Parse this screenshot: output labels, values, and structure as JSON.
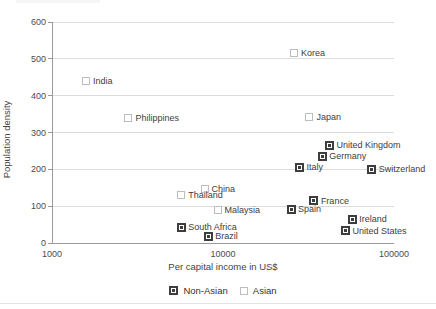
{
  "chart_data": {
    "type": "scatter",
    "title": "",
    "xlabel": "Per capital income in US$",
    "ylabel": "Population density",
    "x_axis": {
      "scale": "log",
      "min": 1000,
      "max": 100000,
      "ticks": [
        1000,
        10000,
        100000
      ]
    },
    "y_axis": {
      "min": 0,
      "max": 600,
      "ticks": [
        0,
        100,
        200,
        300,
        400,
        500,
        600
      ]
    },
    "grid": "horizontal",
    "legend_position": "bottom",
    "colors": {
      "non_asian_marker": "#3d3d3d",
      "asian_marker": "#bdbdbd",
      "gridline": "#dcdcdc",
      "axis": "#9a9a9a"
    },
    "series": [
      {
        "name": "Non-Asian",
        "marker": "filled-square",
        "points": [
          {
            "label": "United Kingdom",
            "x": 42000,
            "y": 265
          },
          {
            "label": "Germany",
            "x": 38000,
            "y": 235
          },
          {
            "label": "Italy",
            "x": 28000,
            "y": 205
          },
          {
            "label": "Switzerland",
            "x": 74000,
            "y": 200
          },
          {
            "label": "France",
            "x": 34000,
            "y": 115
          },
          {
            "label": "Spain",
            "x": 25000,
            "y": 92
          },
          {
            "label": "Ireland",
            "x": 57000,
            "y": 65
          },
          {
            "label": "United States",
            "x": 52000,
            "y": 33
          },
          {
            "label": "South Africa",
            "x": 5700,
            "y": 43
          },
          {
            "label": "Brazil",
            "x": 8200,
            "y": 19
          }
        ]
      },
      {
        "name": "Asian",
        "marker": "open-square",
        "points": [
          {
            "label": "Korea",
            "x": 26000,
            "y": 515
          },
          {
            "label": "India",
            "x": 1580,
            "y": 440
          },
          {
            "label": "Philippines",
            "x": 2800,
            "y": 339
          },
          {
            "label": "Japan",
            "x": 32000,
            "y": 342
          },
          {
            "label": "China",
            "x": 7800,
            "y": 146
          },
          {
            "label": "Thailand",
            "x": 5700,
            "y": 130
          },
          {
            "label": "Malaysia",
            "x": 9300,
            "y": 90
          }
        ]
      }
    ],
    "legend": [
      "Non-Asian",
      "Asian"
    ]
  }
}
